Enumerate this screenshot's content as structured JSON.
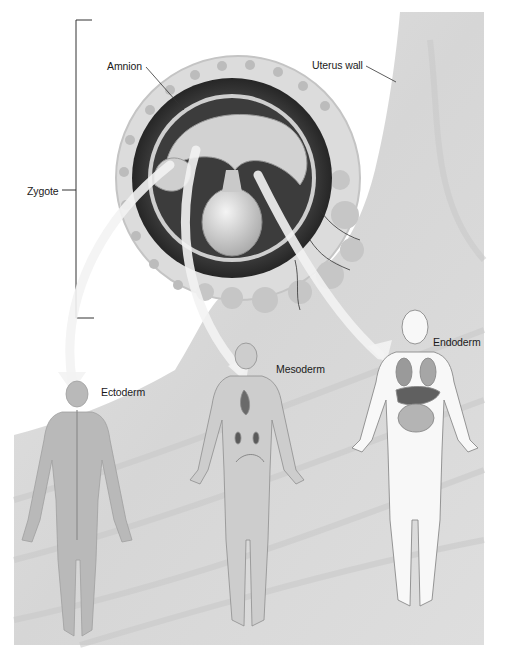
{
  "figure": {
    "type": "biology illustration"
  },
  "labels": {
    "amnion": "Amnion",
    "uterus_wall": "Uterus wall",
    "zygote": "Zygote",
    "ectoderm": "Ectoderm",
    "mesoderm": "Mesoderm",
    "endoderm": "Endoderm"
  },
  "colors": {
    "tissue": "#d9d9d9",
    "tissue_light": "#e6e6e6",
    "dark_band": "#3a3a3a",
    "body_fill": "#bdbdbd",
    "endoderm_body": "#f7f7f7",
    "arrow": "#f2f2f2",
    "leader_line": "#333333"
  }
}
